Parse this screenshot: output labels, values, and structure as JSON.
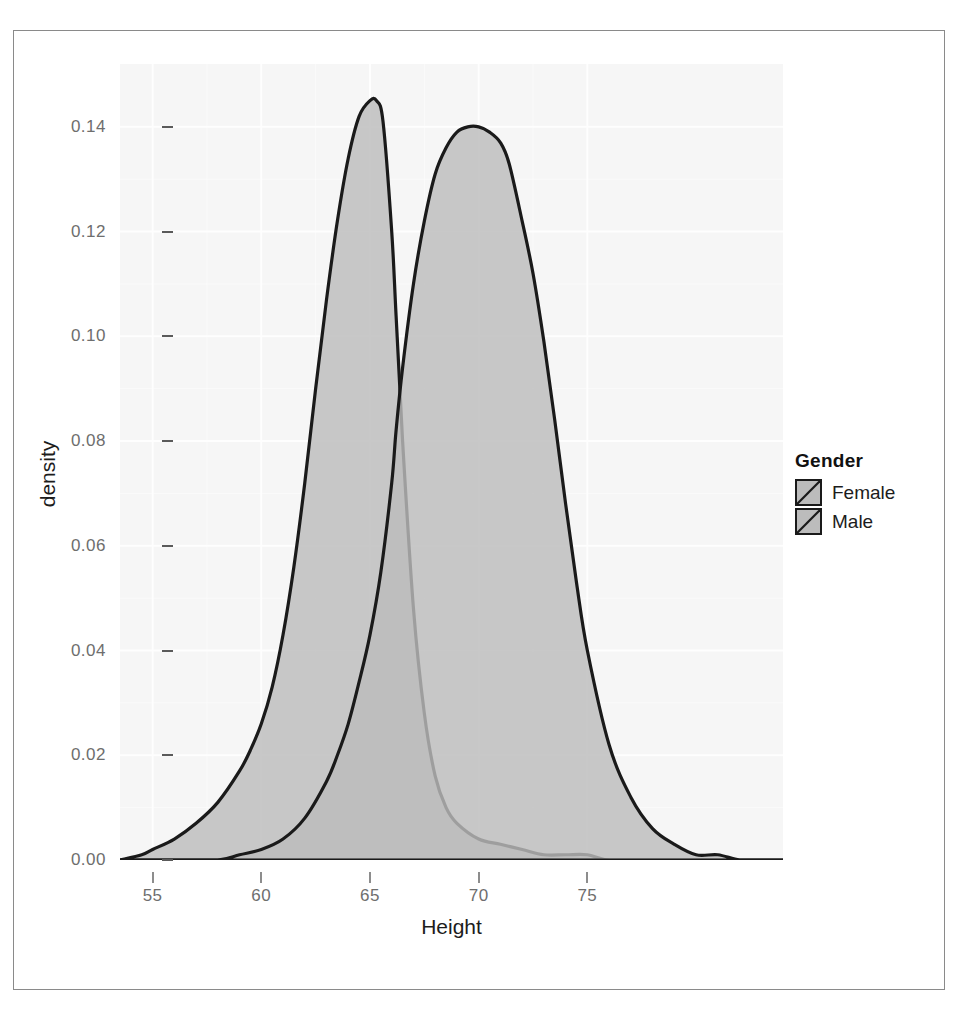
{
  "chart_data": {
    "type": "area",
    "title": "",
    "subtitle": "",
    "xlabel": "Height",
    "ylabel": "density",
    "xlim": [
      53.5,
      84.0
    ],
    "ylim": [
      0.0,
      0.152
    ],
    "xticks": [
      "55",
      "60",
      "65",
      "70",
      "75"
    ],
    "xtick_values": [
      55,
      60,
      65,
      70,
      75
    ],
    "yticks": [
      "0.00",
      "0.02",
      "0.04",
      "0.06",
      "0.08",
      "0.10",
      "0.12",
      "0.14"
    ],
    "ytick_values": [
      0.0,
      0.02,
      0.04,
      0.06,
      0.08,
      0.1,
      0.12,
      0.14
    ],
    "grid": true,
    "legend_position": "right",
    "legend_title": "Gender",
    "fill_color": "#bcbcbc",
    "line_color": "#1a1a1a",
    "panel_background": "#f6f6f6",
    "gridline_color": "#ffffff",
    "series": [
      {
        "name": "Female",
        "peak_x": 65.3,
        "peak_y": 0.145,
        "x": [
          53.5,
          54.5,
          55.0,
          56.0,
          57.0,
          58.0,
          59.0,
          59.5,
          60.0,
          60.5,
          61.0,
          61.5,
          62.0,
          62.5,
          63.0,
          63.5,
          64.0,
          64.5,
          65.0,
          65.3,
          65.6,
          66.0,
          66.2,
          66.5,
          67.0,
          67.5,
          68.0,
          68.5,
          69.0,
          70.0,
          71.0,
          72.0,
          73.0,
          74.0,
          75.0,
          76.0,
          78.0,
          80.0,
          82.0,
          84.0
        ],
        "y": [
          0.0,
          0.001,
          0.002,
          0.004,
          0.007,
          0.011,
          0.017,
          0.021,
          0.026,
          0.033,
          0.043,
          0.056,
          0.072,
          0.09,
          0.107,
          0.122,
          0.134,
          0.142,
          0.145,
          0.145,
          0.141,
          0.12,
          0.104,
          0.08,
          0.048,
          0.028,
          0.016,
          0.01,
          0.007,
          0.004,
          0.003,
          0.002,
          0.001,
          0.001,
          0.001,
          0.0,
          0.0,
          0.0,
          0.0,
          0.0
        ]
      },
      {
        "name": "Male",
        "peak_x": 71.0,
        "peak_y": 0.14,
        "x": [
          53.5,
          56.0,
          58.0,
          59.0,
          60.0,
          61.0,
          62.0,
          63.0,
          63.5,
          64.0,
          64.5,
          65.0,
          65.5,
          66.0,
          66.2,
          66.5,
          67.0,
          67.5,
          68.0,
          68.5,
          69.0,
          69.5,
          70.0,
          70.5,
          71.0,
          71.4,
          72.0,
          72.5,
          73.0,
          73.5,
          74.0,
          74.5,
          75.0,
          76.0,
          77.0,
          78.0,
          79.0,
          80.0,
          81.0,
          82.0,
          83.0,
          84.0
        ],
        "y": [
          0.0,
          0.0,
          0.0,
          0.001,
          0.002,
          0.004,
          0.008,
          0.015,
          0.02,
          0.026,
          0.034,
          0.043,
          0.055,
          0.072,
          0.082,
          0.094,
          0.11,
          0.122,
          0.131,
          0.136,
          0.139,
          0.14,
          0.14,
          0.139,
          0.137,
          0.133,
          0.122,
          0.112,
          0.099,
          0.084,
          0.068,
          0.053,
          0.04,
          0.022,
          0.012,
          0.006,
          0.003,
          0.001,
          0.001,
          0.0,
          0.0,
          0.0
        ]
      }
    ]
  },
  "axes": {
    "x": {
      "title": "Height",
      "ticks": [
        "55",
        "60",
        "65",
        "70",
        "75"
      ]
    },
    "y": {
      "title": "density",
      "ticks": [
        "0.00",
        "0.02",
        "0.04",
        "0.06",
        "0.08",
        "0.10",
        "0.12",
        "0.14"
      ]
    }
  },
  "legend": {
    "title": "Gender",
    "items": [
      {
        "label": "Female"
      },
      {
        "label": "Male"
      }
    ]
  }
}
